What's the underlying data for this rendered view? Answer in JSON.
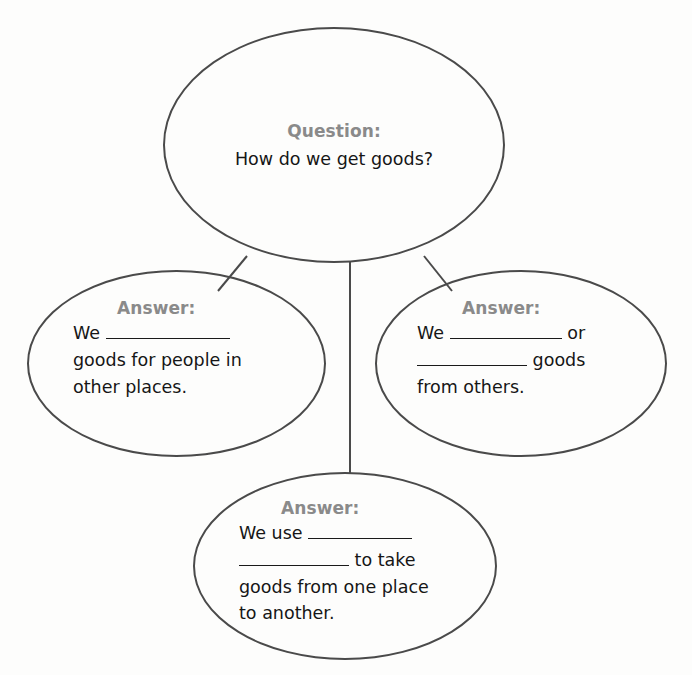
{
  "page": {
    "type": "graphic-organizer",
    "background_color": "#fdfdfc",
    "outline_color": "#4a4a4a",
    "heading_color": "#8a8a8a",
    "text_color": "#161616"
  },
  "question_node": {
    "heading": "Question:",
    "text": "How do we get goods?"
  },
  "answer_left": {
    "heading": "Answer:",
    "line1_before": "We",
    "line1_blank": "",
    "line2": "goods for people in",
    "line3": "other places."
  },
  "answer_right": {
    "heading": "Answer:",
    "line1_before": "We",
    "line1_blank": "",
    "line1_after": "or",
    "line2_blank": "",
    "line2_after": "goods",
    "line3": "from others."
  },
  "answer_bottom": {
    "heading": "Answer:",
    "line1_before": "We use",
    "line1_blank": "",
    "line2_blank": "",
    "line2_after": "to take",
    "line3": "goods from one place",
    "line4": "to another."
  },
  "connectors": [
    {
      "name": "question-to-left",
      "from": [
        247,
        256
      ],
      "to": [
        218,
        290
      ]
    },
    {
      "name": "question-to-bottom",
      "from": [
        350,
        263
      ],
      "to": [
        350,
        472
      ]
    },
    {
      "name": "question-to-right",
      "from": [
        425,
        256
      ],
      "to": [
        452,
        290
      ]
    }
  ]
}
